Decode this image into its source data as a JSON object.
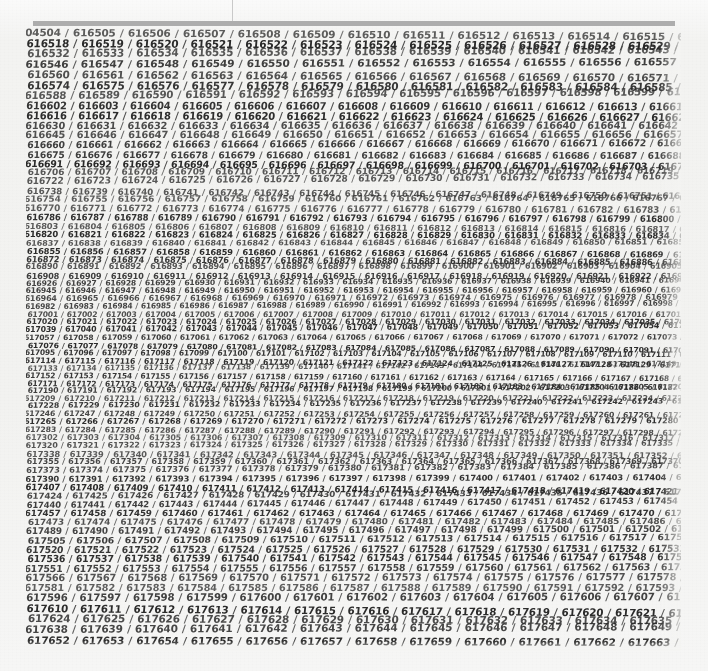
{
  "artwork": {
    "medium_note": "handwritten sequential six-digit numbers, ink on paper",
    "background_color": "#f2f2f0",
    "ink_color": "#2d2d2d",
    "rule_color": "#adadad",
    "registration_line_color": "#c9c9c9"
  },
  "top_rule": {
    "label": "horizontal gray rule",
    "x": 33,
    "y": 21,
    "width": 642,
    "height": 5
  },
  "registration_line": {
    "label": "faint vertical line",
    "x": 232,
    "y": 0,
    "height": 22
  },
  "number_field": {
    "label": "field of handwritten sequential numbers",
    "separator": "/",
    "first_number": "616504",
    "last_number": "618097",
    "total_count": 1594,
    "line_count": 70,
    "x": 26,
    "y": 27,
    "width": 655,
    "height": 624,
    "first_line_clipped_prefix": "504",
    "last_line_sample": "618090 / 618091 / 618092 / 618093 / 618094 / 618095 / 618096 / 618097",
    "first_line_sample": "504 / 616505 / 616506 / 616507 / 616508 / 616509 / 616510 / 616511",
    "sample_rows": [
      "616504 / 616505 / 616506 / 616507 / 616508 / 616509 / 616510 / 616511",
      "616523 / 616524 / 616525 / 616526 / 616527 / 616528 / 616529 / 616530",
      "616543 / 616544 / 616545 / 616546 / 616547 / 616548 / 616549 / 616550",
      "616802 / 616803 / 616804 / 616805 / 616806 / 616807 / 616808 / 616809",
      "617077 / 617078 / 617079 / 617080 / 617081 / 617082 / 617083 / 617084",
      "617595 / 617596 / 617597 / 617598 / 617599 / 617600 / 617601 / 617602",
      "618090 / 618091 / 618092 / 618093 / 618094 / 618095 / 618096 / 618097"
    ]
  }
}
